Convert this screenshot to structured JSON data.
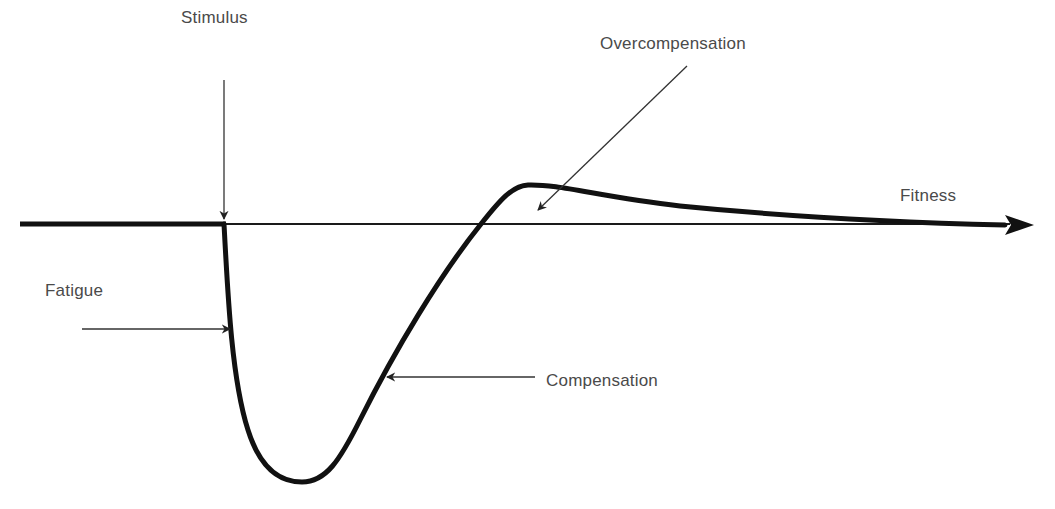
{
  "diagram": {
    "type": "supercompensation-curve",
    "colors": {
      "curve": "#111111",
      "baseline": "#1a1a1a",
      "text": "#4a4a4a",
      "background": "#ffffff"
    },
    "labels": {
      "stimulus": "Stimulus",
      "overcompensation": "Overcompensation",
      "fitness": "Fitness",
      "fatigue": "Fatigue",
      "compensation": "Compensation"
    },
    "phases": [
      {
        "name": "Stimulus",
        "description": "Point where training stimulus is applied on the baseline"
      },
      {
        "name": "Fatigue",
        "description": "Sharp drop in fitness below baseline"
      },
      {
        "name": "Compensation",
        "description": "Recovery back toward baseline"
      },
      {
        "name": "Overcompensation",
        "description": "Fitness peak above baseline"
      },
      {
        "name": "Fitness",
        "description": "Baseline axis arrow; curve decays back to baseline"
      }
    ]
  }
}
